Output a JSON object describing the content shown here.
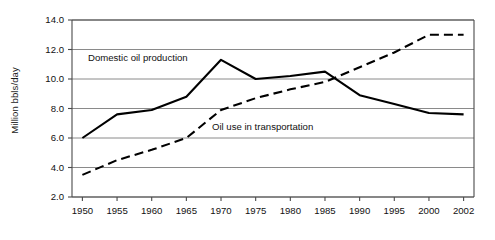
{
  "chart_data": {
    "type": "line",
    "title": "",
    "xlabel": "",
    "ylabel": "Million bbls/day",
    "categories": [
      "1950",
      "1955",
      "1960",
      "1965",
      "1970",
      "1975",
      "1980",
      "1985",
      "1990",
      "1995",
      "2000",
      "2002"
    ],
    "x": [
      1950,
      1955,
      1960,
      1965,
      1970,
      1975,
      1980,
      1985,
      1990,
      1995,
      2000,
      2002
    ],
    "ylim": [
      2.0,
      14.0
    ],
    "ytick_labels": [
      "2.0",
      "4.0",
      "6.0",
      "8.0",
      "10.0",
      "12.0",
      "14.0"
    ],
    "yticks": [
      2.0,
      4.0,
      6.0,
      8.0,
      10.0,
      12.0,
      14.0
    ],
    "grid": true,
    "legend_position": "inline-annotations",
    "series": [
      {
        "name": "Domestic oil production",
        "style": "solid",
        "color": "#000000",
        "values": [
          6.0,
          7.6,
          7.9,
          8.8,
          11.3,
          10.0,
          10.2,
          10.5,
          8.9,
          8.3,
          7.7,
          7.6
        ]
      },
      {
        "name": "Oil use in transportation",
        "style": "dashed",
        "color": "#000000",
        "values": [
          3.5,
          4.5,
          5.2,
          6.0,
          7.9,
          8.7,
          9.3,
          9.8,
          10.8,
          11.8,
          13.0,
          13.0
        ]
      }
    ],
    "annotations": [
      {
        "text": "Domestic oil production",
        "x_value": 1958.0,
        "y_value": 11.25
      },
      {
        "text": "Oil use in transportation",
        "x_value": 1976.0,
        "y_value": 6.55
      }
    ]
  },
  "axes": {
    "y_axis_title": "Million bbls/day"
  }
}
